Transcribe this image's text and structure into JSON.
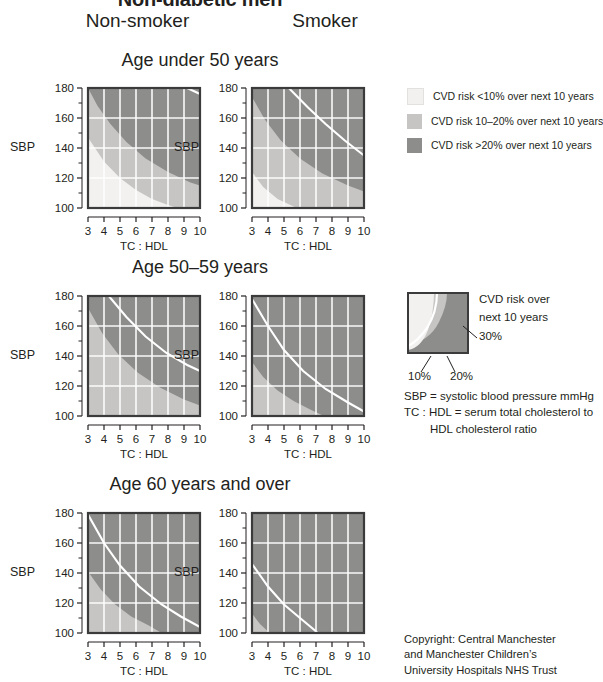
{
  "title": "Non-diabetic men",
  "columns": [
    {
      "label": "Non-smoker"
    },
    {
      "label": "Smoker"
    }
  ],
  "axis": {
    "y_label": "SBP",
    "x_label": "TC : HDL",
    "y_ticks": [
      "100",
      "120",
      "140",
      "160",
      "180"
    ],
    "y_minor_ticks": [
      "110",
      "130",
      "150",
      "170"
    ],
    "x_ticks": [
      "3",
      "4",
      "5",
      "6",
      "7",
      "8",
      "9",
      "10"
    ],
    "y_range": [
      100,
      180
    ],
    "x_range": [
      3,
      10
    ]
  },
  "colors": {
    "risk_low": "#f2f1ef",
    "risk_mid": "#c6c5c3",
    "risk_high": "#8d8d8c",
    "gridline": "#ffffff",
    "border": "#3b3b3b",
    "text": "#231f20"
  },
  "legend": {
    "items": [
      {
        "swatch": "risk_low",
        "text": "CVD risk <10% over next 10 years"
      },
      {
        "swatch": "risk_mid",
        "text": "CVD risk 10–20% over next 10 years"
      },
      {
        "swatch": "risk_high",
        "text": "CVD risk >20% over next 10 years"
      }
    ]
  },
  "mini_key": {
    "heading_line1": "CVD risk over",
    "heading_line2": "next 10 years",
    "label_30": "30%",
    "label_10": "10%",
    "label_20": "20%"
  },
  "definitions": {
    "sbp": "SBP = systolic blood pressure mmHg",
    "tchdl": "TC : HDL = serum total cholesterol to",
    "tchdl_cont": "HDL cholesterol ratio"
  },
  "copyright": {
    "line1": "Copyright: Central Manchester",
    "line2": "and Manchester Children’s",
    "line3": "University Hospitals NHS Trust"
  },
  "sections": [
    {
      "heading": "Age under 50 years"
    },
    {
      "heading": "Age 50–59 years"
    },
    {
      "heading": "Age 60 years and over"
    }
  ],
  "chart_data": {
    "type": "heatmap",
    "xlabel": "TC : HDL",
    "ylabel": "SBP",
    "xlim": [
      3,
      10
    ],
    "ylim": [
      100,
      180
    ],
    "grid": true,
    "legend_position": "right",
    "risk_bands": [
      {
        "name": "<10%",
        "color": "#f2f1ef"
      },
      {
        "name": "10-20%",
        "color": "#c6c5c3"
      },
      {
        "name": ">20%",
        "color": "#8d8d8c"
      }
    ],
    "panels": [
      {
        "age_group": "Age under 50 years",
        "smoking": "Non-smoker",
        "boundary_10pct": [
          [
            3,
            147
          ],
          [
            4,
            131
          ],
          [
            5,
            120
          ],
          [
            6,
            112
          ],
          [
            7,
            106
          ],
          [
            8,
            102
          ],
          [
            8.6,
            100
          ]
        ],
        "boundary_20pct": [
          [
            3,
            180
          ],
          [
            3.6,
            168
          ],
          [
            4.4,
            156
          ],
          [
            5.4,
            144
          ],
          [
            6.6,
            133
          ],
          [
            8,
            124
          ],
          [
            9.4,
            117
          ],
          [
            10,
            115
          ]
        ],
        "boundary_30pct": [
          [
            9.2,
            180
          ],
          [
            10,
            176
          ]
        ],
        "curve_30_visible": true
      },
      {
        "age_group": "Age under 50 years",
        "smoking": "Smoker",
        "boundary_10pct": [
          [
            3,
            124
          ],
          [
            3.7,
            114
          ],
          [
            4.6,
            106
          ],
          [
            5.6,
            101
          ],
          [
            5.9,
            100
          ]
        ],
        "boundary_20pct": [
          [
            3,
            174
          ],
          [
            3.8,
            159
          ],
          [
            4.8,
            145
          ],
          [
            6,
            133
          ],
          [
            7.4,
            123
          ],
          [
            9,
            115
          ],
          [
            10,
            111
          ]
        ],
        "boundary_30pct": [
          [
            5.3,
            180
          ],
          [
            6.5,
            167
          ],
          [
            7.6,
            156
          ],
          [
            8.8,
            145
          ],
          [
            10,
            135
          ]
        ],
        "curve_30_visible": true
      },
      {
        "age_group": "Age 50–59 years",
        "smoking": "Non-smoker",
        "boundary_10pct": null,
        "boundary_20pct": [
          [
            3,
            172
          ],
          [
            3.9,
            155
          ],
          [
            4.9,
            141
          ],
          [
            6.1,
            129
          ],
          [
            7.5,
            119
          ],
          [
            9,
            111
          ],
          [
            10,
            107
          ]
        ],
        "boundary_30pct": [
          [
            4.3,
            180
          ],
          [
            5.4,
            166
          ],
          [
            6.6,
            153
          ],
          [
            7.9,
            142
          ],
          [
            9.2,
            134
          ],
          [
            10,
            130
          ]
        ],
        "curve_30_visible": true
      },
      {
        "age_group": "Age 50–59 years",
        "smoking": "Smoker",
        "boundary_10pct": null,
        "boundary_20pct": [
          [
            3,
            136
          ],
          [
            3.7,
            126
          ],
          [
            4.6,
            117
          ],
          [
            5.6,
            110
          ],
          [
            6.7,
            104
          ],
          [
            7.5,
            100
          ]
        ],
        "boundary_30pct": [
          [
            3,
            178
          ],
          [
            4,
            160
          ],
          [
            5,
            144
          ],
          [
            6.2,
            130
          ],
          [
            7.6,
            118
          ],
          [
            9,
            109
          ],
          [
            10,
            103
          ]
        ],
        "curve_30_visible": true
      },
      {
        "age_group": "Age 60 years and over",
        "smoking": "Non-smoker",
        "boundary_10pct": null,
        "boundary_20pct": [
          [
            3,
            141
          ],
          [
            3.8,
            129
          ],
          [
            4.7,
            119
          ],
          [
            5.7,
            111
          ],
          [
            6.8,
            105
          ],
          [
            7.6,
            100
          ]
        ],
        "boundary_30pct": [
          [
            3,
            179
          ],
          [
            4,
            160
          ],
          [
            5,
            145
          ],
          [
            6.2,
            131
          ],
          [
            7.6,
            119
          ],
          [
            8.8,
            111
          ],
          [
            10,
            104
          ]
        ],
        "curve_30_visible": true
      },
      {
        "age_group": "Age 60 years and over",
        "smoking": "Smoker",
        "boundary_10pct": null,
        "boundary_20pct": [
          [
            3,
            113
          ],
          [
            3.5,
            106
          ],
          [
            4.1,
            100
          ]
        ],
        "boundary_30pct": [
          [
            3,
            146
          ],
          [
            4,
            131
          ],
          [
            5,
            119
          ],
          [
            6,
            110
          ],
          [
            6.9,
            102
          ],
          [
            7.1,
            100
          ]
        ],
        "curve_30_visible": true
      }
    ]
  }
}
